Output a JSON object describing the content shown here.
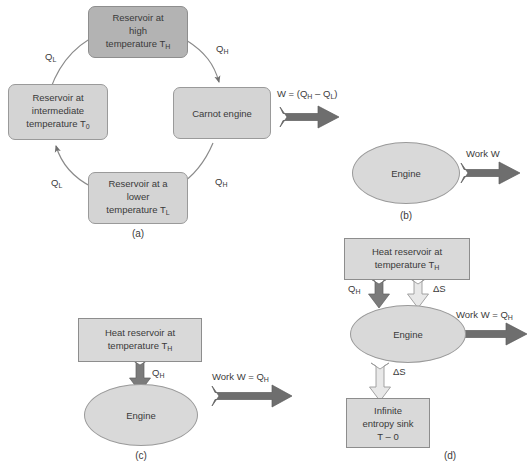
{
  "figure": {
    "colors": {
      "box_dark_fill": "#b3b3b3",
      "box_light_fill": "#d4d4d4",
      "box_square_fill": "#d9d9d9",
      "ellipse_fill": "#d9d9d9",
      "arrow_dark_fill": "#6e6e6e",
      "arrow_light_fill": "#e6e6e6",
      "outline": "#8e8e8e",
      "text": "#3a3a3a",
      "background": "#ffffff"
    }
  },
  "panel_a": {
    "label": "(a)",
    "reservoir_high": {
      "lines": [
        "Reservoir at",
        "high",
        "temperature T"
      ],
      "subscript": "H"
    },
    "reservoir_intermediate": {
      "lines": [
        "Reservoir at",
        "intermediate",
        "temperature T"
      ],
      "subscript": "0"
    },
    "reservoir_lower": {
      "lines": [
        "Reservoir at a",
        "lower",
        "temperature T"
      ],
      "subscript": "L"
    },
    "engine": {
      "label": "Carnot engine"
    },
    "flow_labels": {
      "q_l_upper": "Q",
      "q_l_upper_sub": "L",
      "q_h_upper": "Q",
      "q_h_upper_sub": "H",
      "q_l_lower": "Q",
      "q_l_lower_sub": "L",
      "q_h_lower": "Q",
      "q_h_lower_sub": "H"
    },
    "work_label": "W = (Q",
    "work_label_sub1": "H",
    "work_label_mid": " – Q",
    "work_label_sub2": "L",
    "work_label_end": ")"
  },
  "panel_b": {
    "label": "(b)",
    "engine": {
      "label": "Engine"
    },
    "work_label": "Work W"
  },
  "panel_c": {
    "label": "(c)",
    "reservoir": {
      "lines": [
        "Heat reservoir at",
        "temperature T"
      ],
      "subscript": "H"
    },
    "engine": {
      "label": "Engine"
    },
    "heat_label": "Q",
    "heat_label_sub": "H",
    "work_label": "Work W = Q",
    "work_label_sub": "H"
  },
  "panel_d": {
    "label": "(d)",
    "reservoir": {
      "lines": [
        "Heat reservoir at",
        "temperature T"
      ],
      "subscript": "H"
    },
    "engine": {
      "label": "Engine"
    },
    "sink": {
      "lines": [
        "Infinite",
        "entropy sink",
        "T – 0"
      ]
    },
    "heat_label": "Q",
    "heat_label_sub": "H",
    "entropy_in_label": "ΔS",
    "entropy_out_label": "ΔS",
    "work_label": "Work W = Q",
    "work_label_sub": "H"
  }
}
